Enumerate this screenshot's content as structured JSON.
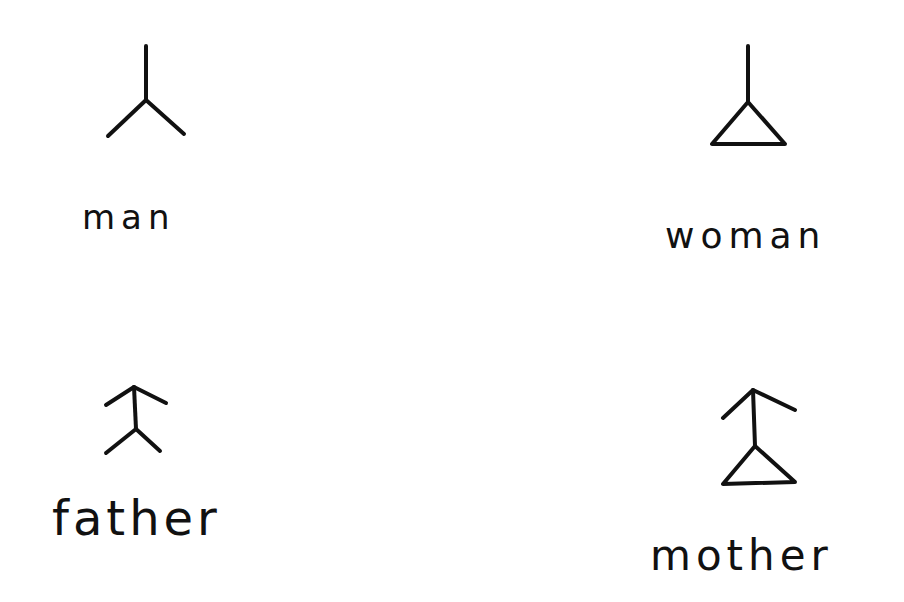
{
  "diagram": {
    "style": "hand-drawn ink symbols on white paper",
    "ink_color": "#111111",
    "background": "#ffffff",
    "items": [
      {
        "id": "man",
        "label": "man",
        "symbol": "vertical stem ending in inverted-V (two legs)"
      },
      {
        "id": "woman",
        "label": "woman",
        "symbol": "vertical stem ending in triangle"
      },
      {
        "id": "father",
        "label": "father",
        "symbol": "man symbol with upward arrowhead (caret) at top"
      },
      {
        "id": "mother",
        "label": "mother",
        "symbol": "woman symbol with upward arrowhead (caret) at top"
      }
    ]
  }
}
